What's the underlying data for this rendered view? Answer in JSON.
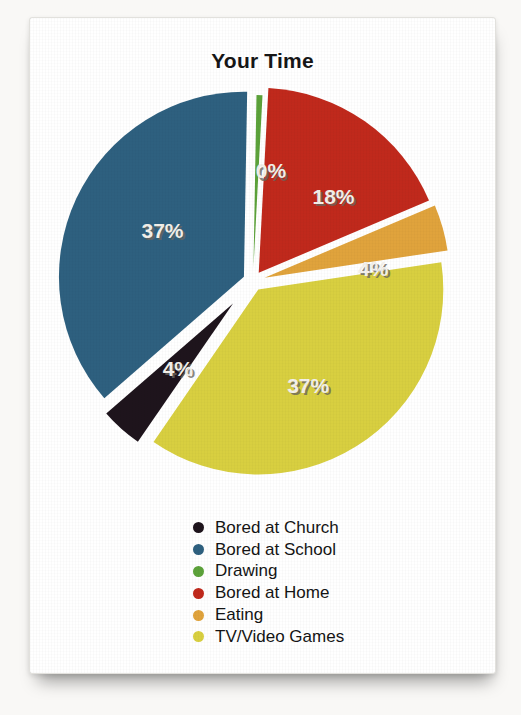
{
  "chart_data": {
    "type": "pie",
    "title": "Your Time",
    "legend_position": "bottom-center",
    "background": "#ffffff",
    "label_text_color": "#f3f0ea",
    "label_shadow_color": "#6b665e",
    "slices": [
      {
        "label": "Bored at Church",
        "value": 4,
        "display": "4%",
        "color": "#1e141c",
        "draw_deg": 14.5,
        "explode": 30,
        "radius": 168,
        "label_deg": 220.8,
        "label_r": 115
      },
      {
        "label": "Bored at School",
        "value": 37,
        "display": "37%",
        "color": "#2e607f",
        "draw_deg": 132,
        "explode": 10,
        "radius": 185,
        "label_deg": 299.5,
        "label_r": 104
      },
      {
        "label": "Drawing",
        "value": 0,
        "display": "0%",
        "color": "#5ca23a",
        "draw_deg": 2,
        "explode": 14,
        "radius": 172,
        "label_deg": 9.2,
        "label_r": 112
      },
      {
        "label": "Bored at Home",
        "value": 18,
        "display": "18%",
        "color": "#c0291c",
        "draw_deg": 64,
        "explode": 10,
        "radius": 185,
        "label_deg": 43.5,
        "label_r": 117
      },
      {
        "label": "Eating",
        "value": 4,
        "display": "4%",
        "color": "#e0a33c",
        "draw_deg": 14.5,
        "explode": 12,
        "radius": 185,
        "label_deg": 83.8,
        "label_r": 121
      },
      {
        "label": "TV/Video Games",
        "value": 37,
        "display": "37%",
        "color": "#d8cf40",
        "draw_deg": 133,
        "explode": 10,
        "radius": 185,
        "label_deg": 152.1,
        "label_r": 118
      }
    ],
    "draw_order": [
      "Drawing",
      "Bored at Home",
      "Eating",
      "TV/Video Games",
      "Bored at Church",
      "Bored at School"
    ],
    "start_deg": 1,
    "geometry": {
      "cx": 223,
      "cy": 263,
      "r": 185
    }
  }
}
